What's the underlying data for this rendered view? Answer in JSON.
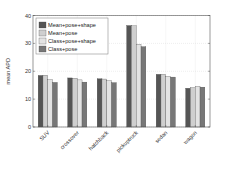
{
  "chart_data": {
    "type": "bar",
    "title": "",
    "xlabel": "",
    "ylabel": "mean APD",
    "ylim": [
      0,
      40
    ],
    "yticks": [
      0,
      10,
      20,
      30,
      40
    ],
    "grid": true,
    "legend_position": "upper left",
    "categories": [
      "SUV",
      "crossover",
      "hatchback",
      "pickuptruck",
      "sedan",
      "wagon"
    ],
    "series": [
      {
        "name": "Mean+pose+shape",
        "color": "#555555",
        "values": [
          18.5,
          17.6,
          17.3,
          36.4,
          18.9,
          13.9
        ]
      },
      {
        "name": "Mean+pose",
        "color": "#cfcfcf",
        "values": [
          18.6,
          17.5,
          17.2,
          36.3,
          18.9,
          14.1
        ]
      },
      {
        "name": "Class+pose+shape",
        "color": "#e3e3e3",
        "values": [
          17.0,
          16.9,
          16.6,
          29.7,
          18.2,
          14.6
        ]
      },
      {
        "name": "Class+pose",
        "color": "#777777",
        "values": [
          16.0,
          16.1,
          15.9,
          28.8,
          17.9,
          14.3
        ]
      }
    ]
  }
}
